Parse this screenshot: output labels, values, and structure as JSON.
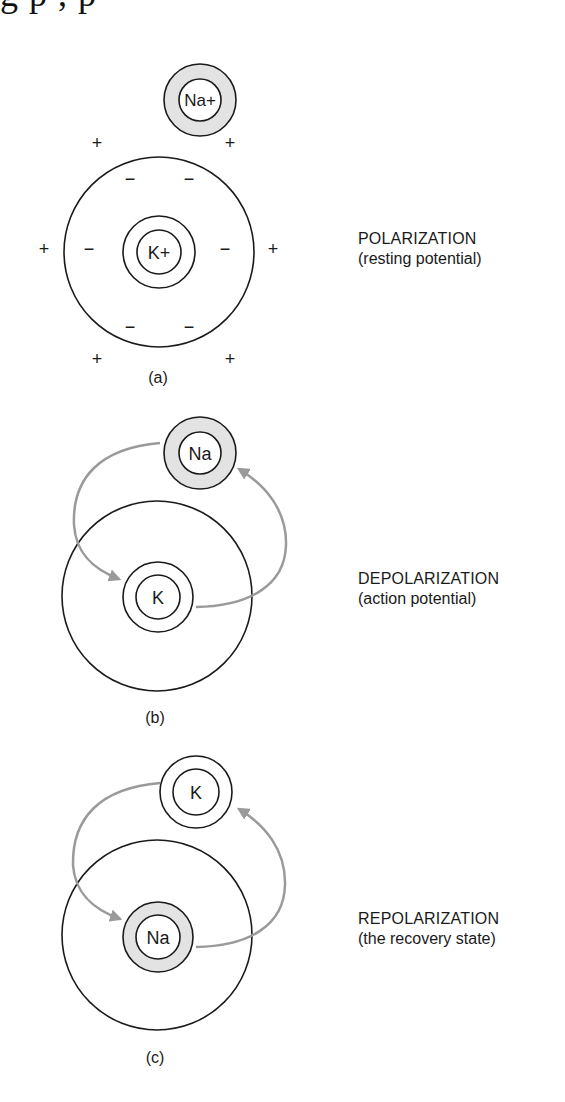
{
  "header": {
    "clipped_text_fragment": "g            p             ,          p"
  },
  "colors": {
    "stroke": "#1a1a1a",
    "shaded_ring": "#e3e3e3",
    "arrow": "#9a9a9a",
    "background": "#ffffff"
  },
  "panels": [
    {
      "id": "a",
      "label": "(a)",
      "title": "POLARIZATION",
      "subtitle": "(resting potential)",
      "outer_ion": {
        "symbol": "Na+",
        "shaded": true
      },
      "inner_ion": {
        "symbol": "K+",
        "shaded": false
      },
      "outside_charges": [
        "+",
        "+",
        "+",
        "+",
        "+",
        "+"
      ],
      "inside_charges": [
        "−",
        "−",
        "−",
        "−",
        "−",
        "−"
      ],
      "arrows": false
    },
    {
      "id": "b",
      "label": "(b)",
      "title": "DEPOLARIZATION",
      "subtitle": "(action potential)",
      "outer_ion": {
        "symbol": "Na",
        "shaded": true
      },
      "inner_ion": {
        "symbol": "K",
        "shaded": false
      },
      "arrows": true
    },
    {
      "id": "c",
      "label": "(c)",
      "title": "REPOLARIZATION",
      "subtitle": "(the recovery state)",
      "outer_ion": {
        "symbol": "K",
        "shaded": false
      },
      "inner_ion": {
        "symbol": "Na",
        "shaded": true
      },
      "arrows": true
    }
  ]
}
